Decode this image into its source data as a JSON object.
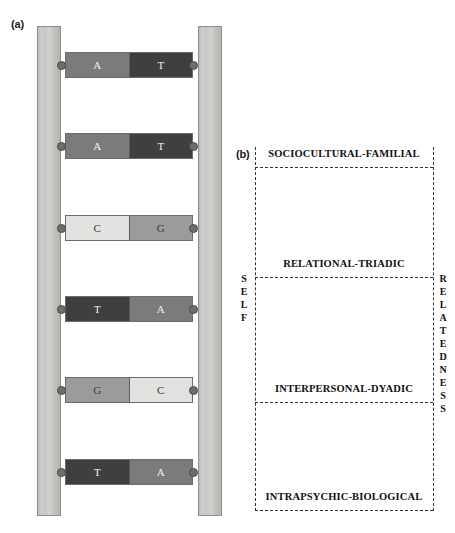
{
  "figure": {
    "panel_a": {
      "label": "(a)",
      "caption_semantic": "dna-ladder",
      "rails": [
        {
          "name": "left-rail"
        },
        {
          "name": "right-rail"
        }
      ],
      "rungs": [
        {
          "left_base": "A",
          "right_base": "T",
          "left_color": "#7b7b7b",
          "right_color": "#3f3f3f",
          "top": 52
        },
        {
          "left_base": "A",
          "right_base": "T",
          "left_color": "#7b7b7b",
          "right_color": "#3f3f3f",
          "top": 133
        },
        {
          "left_base": "C",
          "right_base": "G",
          "left_color": "#e2e2e0",
          "right_color": "#9b9b9b",
          "top": 215
        },
        {
          "left_base": "T",
          "right_base": "A",
          "left_color": "#3f3f3f",
          "right_color": "#7b7b7b",
          "top": 296
        },
        {
          "left_base": "G",
          "right_base": "C",
          "left_color": "#9b9b9b",
          "right_color": "#e2e2e0",
          "top": 377
        },
        {
          "left_base": "T",
          "right_base": "A",
          "left_color": "#3f3f3f",
          "right_color": "#7b7b7b",
          "top": 459
        }
      ]
    },
    "panel_b": {
      "label": "(b)",
      "left_axis_label": "SELF",
      "right_axis_label": "RELATEDNESS",
      "levels": [
        {
          "title": "SOCIOCULTURAL-FAMILIAL",
          "title_top": 148,
          "divider_top": 167
        },
        {
          "title": "RELATIONAL-TRIADIC",
          "title_top": 258,
          "divider_top": 277
        },
        {
          "title": "INTERPERSONAL-DYADIC",
          "title_top": 383,
          "divider_top": 402
        },
        {
          "title": "INTRAPSYCHIC-BIOLOGICAL",
          "title_top": 491,
          "divider_top": 510
        }
      ]
    }
  },
  "colors": {
    "rail_fill": "#c9c9c6",
    "rail_stroke": "#8e8e8c",
    "peg_fill": "#6e6e6e",
    "dash_stroke": "#333333",
    "text": "#111111",
    "background": "#ffffff"
  }
}
